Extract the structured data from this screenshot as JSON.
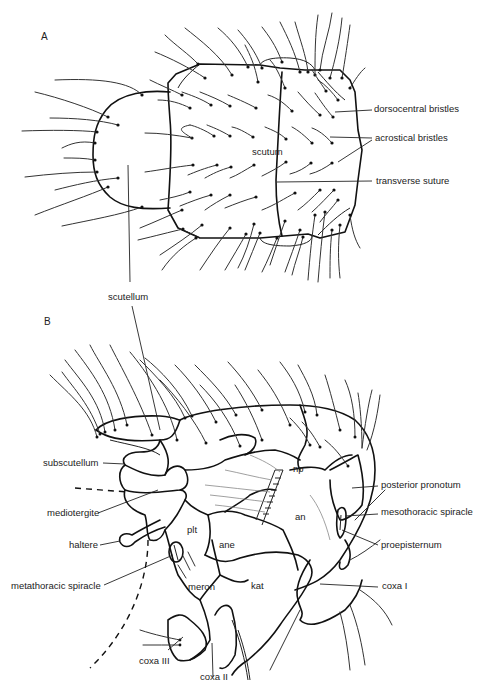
{
  "figure": {
    "panels": [
      {
        "id": "A",
        "label": "A",
        "view": "dorsal",
        "structures": {
          "scutum": "scutum",
          "dorsocentral": "dorsocentral bristles",
          "acrostical": "acrostical bristles",
          "transverse": "transverse suture",
          "scutellum": "scutellum"
        }
      },
      {
        "id": "B",
        "label": "B",
        "view": "lateral",
        "structures": {
          "subscutellum": "subscutellum",
          "mediotergite": "mediotergite",
          "haltere": "haltere",
          "metathoracic_spiracle": "metathoracic spiracle",
          "coxa3": "coxa III",
          "coxa2": "coxa II",
          "plt": "plt",
          "ane": "ane",
          "meron": "meron",
          "kat": "kat",
          "np": "np",
          "an": "an",
          "posterior_pronotum": "posterior pronotum",
          "mesothoracic_spiracle": "mesothoracic spiracle",
          "proepisternum": "proepisternum",
          "coxa1": "coxa I"
        }
      }
    ]
  }
}
